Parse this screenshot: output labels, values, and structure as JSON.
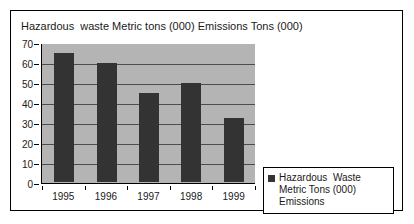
{
  "chart_data": {
    "type": "bar",
    "title": "Hazardous  waste Metric tons (000) Emissions Tons (000)",
    "categories": [
      "1995",
      "1996",
      "1997",
      "1998",
      "1999"
    ],
    "values": [
      65,
      60,
      45,
      50,
      32
    ],
    "series": [
      {
        "name": "Hazardous  Waste Metric Tons (000) Emissions",
        "values": [
          65,
          60,
          45,
          50,
          32
        ]
      }
    ],
    "xlabel": "",
    "ylabel": "",
    "ylim": [
      0,
      70
    ],
    "yticks": [
      0,
      10,
      20,
      30,
      40,
      50,
      60,
      70
    ],
    "ytick_labels": [
      "0",
      "10",
      "20",
      "30",
      "40",
      "50",
      "60",
      "70"
    ],
    "grid": true,
    "grid_axis": "y",
    "legend_position": "bottom-right",
    "legend_entries": [
      "Hazardous  Waste Metric Tons (000) Emissions"
    ],
    "colors": {
      "bar": "#333333",
      "plot_background": "#b4b4b4",
      "gridline": "#4d4d4d",
      "axis": "#000000",
      "frame": "#000000",
      "text": "#1a1a1a",
      "page_background": "#ffffff"
    }
  },
  "legend": {
    "label": "Hazardous  Waste Metric Tons (000) Emissions"
  }
}
